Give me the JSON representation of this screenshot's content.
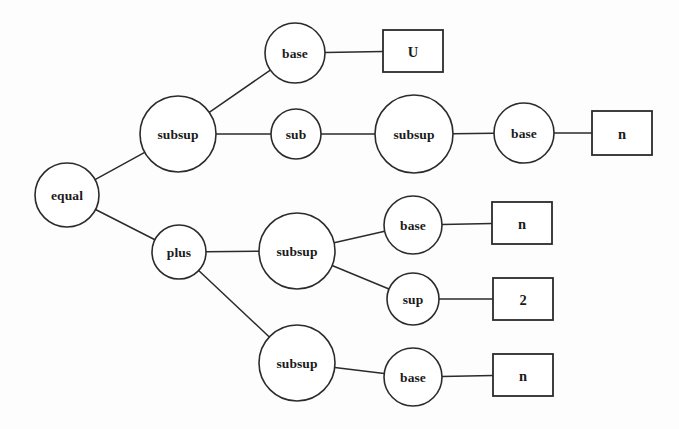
{
  "diagram": {
    "type": "tree",
    "background_color": "#fdfdfd",
    "stroke_color": "#2b2b2b",
    "fill_color": "#ffffff",
    "nodes": [
      {
        "id": "equal",
        "label": "equal",
        "shape": "ellipse",
        "cx": 67,
        "cy": 195,
        "rx": 32,
        "ry": 32
      },
      {
        "id": "subsup1",
        "label": "subsup",
        "shape": "ellipse",
        "cx": 178,
        "cy": 134,
        "rx": 38,
        "ry": 38
      },
      {
        "id": "base1",
        "label": "base",
        "shape": "ellipse",
        "cx": 295,
        "cy": 53,
        "rx": 30,
        "ry": 30
      },
      {
        "id": "leafU",
        "label": "U",
        "shape": "rect",
        "cx": 413,
        "cy": 51,
        "rx": 30,
        "ry": 21
      },
      {
        "id": "sub1",
        "label": "sub",
        "shape": "ellipse",
        "cx": 296,
        "cy": 134,
        "rx": 25,
        "ry": 25
      },
      {
        "id": "subsup2",
        "label": "subsup",
        "shape": "ellipse",
        "cx": 414,
        "cy": 134,
        "rx": 39,
        "ry": 39
      },
      {
        "id": "base2",
        "label": "base",
        "shape": "ellipse",
        "cx": 524,
        "cy": 133,
        "rx": 30,
        "ry": 30
      },
      {
        "id": "leafN1",
        "label": "n",
        "shape": "rect",
        "cx": 622,
        "cy": 133,
        "rx": 30,
        "ry": 22
      },
      {
        "id": "plus",
        "label": "plus",
        "shape": "ellipse",
        "cx": 179,
        "cy": 252,
        "rx": 27,
        "ry": 27
      },
      {
        "id": "subsup3",
        "label": "subsup",
        "shape": "ellipse",
        "cx": 297,
        "cy": 251,
        "rx": 38,
        "ry": 38
      },
      {
        "id": "base3",
        "label": "base",
        "shape": "ellipse",
        "cx": 413,
        "cy": 225,
        "rx": 29,
        "ry": 29
      },
      {
        "id": "leafN2",
        "label": "n",
        "shape": "rect",
        "cx": 522,
        "cy": 223,
        "rx": 30,
        "ry": 21
      },
      {
        "id": "sup1",
        "label": "sup",
        "shape": "ellipse",
        "cx": 413,
        "cy": 299,
        "rx": 26,
        "ry": 26
      },
      {
        "id": "leaf2",
        "label": "2",
        "shape": "rect",
        "cx": 523,
        "cy": 299,
        "rx": 30,
        "ry": 21
      },
      {
        "id": "subsup4",
        "label": "subsup",
        "shape": "ellipse",
        "cx": 297,
        "cy": 363,
        "rx": 38,
        "ry": 38
      },
      {
        "id": "base4",
        "label": "base",
        "shape": "ellipse",
        "cx": 413,
        "cy": 377,
        "rx": 29,
        "ry": 29
      },
      {
        "id": "leafN3",
        "label": "n",
        "shape": "rect",
        "cx": 523,
        "cy": 375,
        "rx": 30,
        "ry": 21
      }
    ],
    "edges": [
      {
        "from": "equal",
        "to": "subsup1"
      },
      {
        "from": "equal",
        "to": "plus"
      },
      {
        "from": "subsup1",
        "to": "base1"
      },
      {
        "from": "subsup1",
        "to": "sub1"
      },
      {
        "from": "base1",
        "to": "leafU"
      },
      {
        "from": "sub1",
        "to": "subsup2"
      },
      {
        "from": "subsup2",
        "to": "base2"
      },
      {
        "from": "base2",
        "to": "leafN1"
      },
      {
        "from": "plus",
        "to": "subsup3"
      },
      {
        "from": "plus",
        "to": "subsup4"
      },
      {
        "from": "subsup3",
        "to": "base3"
      },
      {
        "from": "subsup3",
        "to": "sup1"
      },
      {
        "from": "base3",
        "to": "leafN2"
      },
      {
        "from": "sup1",
        "to": "leaf2"
      },
      {
        "from": "subsup4",
        "to": "base4"
      },
      {
        "from": "base4",
        "to": "leafN3"
      }
    ]
  }
}
